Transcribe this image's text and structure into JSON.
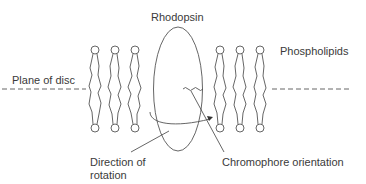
{
  "diagram": {
    "labels": {
      "rhodopsin": "Rhodopsin",
      "phospholipids": "Phospholipids",
      "plane_of_disc": "Plane of disc",
      "direction_of_rotation_line1": "Direction of",
      "direction_of_rotation_line2": "rotation",
      "chromophore_orientation": "Chromophore orientation"
    },
    "phospholipid_columns_x": [
      97,
      117,
      137,
      219,
      239,
      259
    ],
    "colors": {
      "stroke": "#555555",
      "text": "#3a3a3a"
    }
  }
}
